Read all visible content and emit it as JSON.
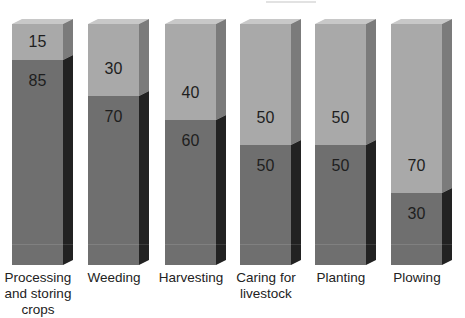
{
  "chart_data": {
    "type": "bar",
    "stacked": true,
    "percent": true,
    "style": "3d",
    "title": "",
    "xlabel": "",
    "ylabel": "",
    "ylim": [
      0,
      100
    ],
    "grid": false,
    "legend": null,
    "categories": [
      "Processing and storing crops",
      "Weeding",
      "Harvesting",
      "Caring for livestock",
      "Planting",
      "Plowing"
    ],
    "series": [
      {
        "name": "bottom (dark)",
        "color": "#6f6f6f",
        "values": [
          85,
          70,
          60,
          50,
          50,
          30
        ]
      },
      {
        "name": "top (light)",
        "color": "#a9a9a9",
        "values": [
          15,
          30,
          40,
          50,
          50,
          70
        ]
      }
    ]
  },
  "bars": [
    {
      "label_line1": "Processing",
      "label_line2": "and storing",
      "label_line3": "crops",
      "dark": "85",
      "light": "15"
    },
    {
      "label_line1": "Weeding",
      "label_line2": "",
      "label_line3": "",
      "dark": "70",
      "light": "30"
    },
    {
      "label_line1": "Harvesting",
      "label_line2": "",
      "label_line3": "",
      "dark": "60",
      "light": "40"
    },
    {
      "label_line1": "Caring for",
      "label_line2": "livestock",
      "label_line3": "",
      "dark": "50",
      "light": "50"
    },
    {
      "label_line1": "Planting",
      "label_line2": "",
      "label_line3": "",
      "dark": "50",
      "light": "50"
    },
    {
      "label_line1": "Plowing",
      "label_line2": "",
      "label_line3": "",
      "dark": "30",
      "light": "70"
    }
  ],
  "colors": {
    "light_front": "#a9a9a9",
    "dark_front": "#6f6f6f",
    "light_side": "#7b7b7b",
    "dark_side": "#222222",
    "cap": "#c8c8c8"
  }
}
